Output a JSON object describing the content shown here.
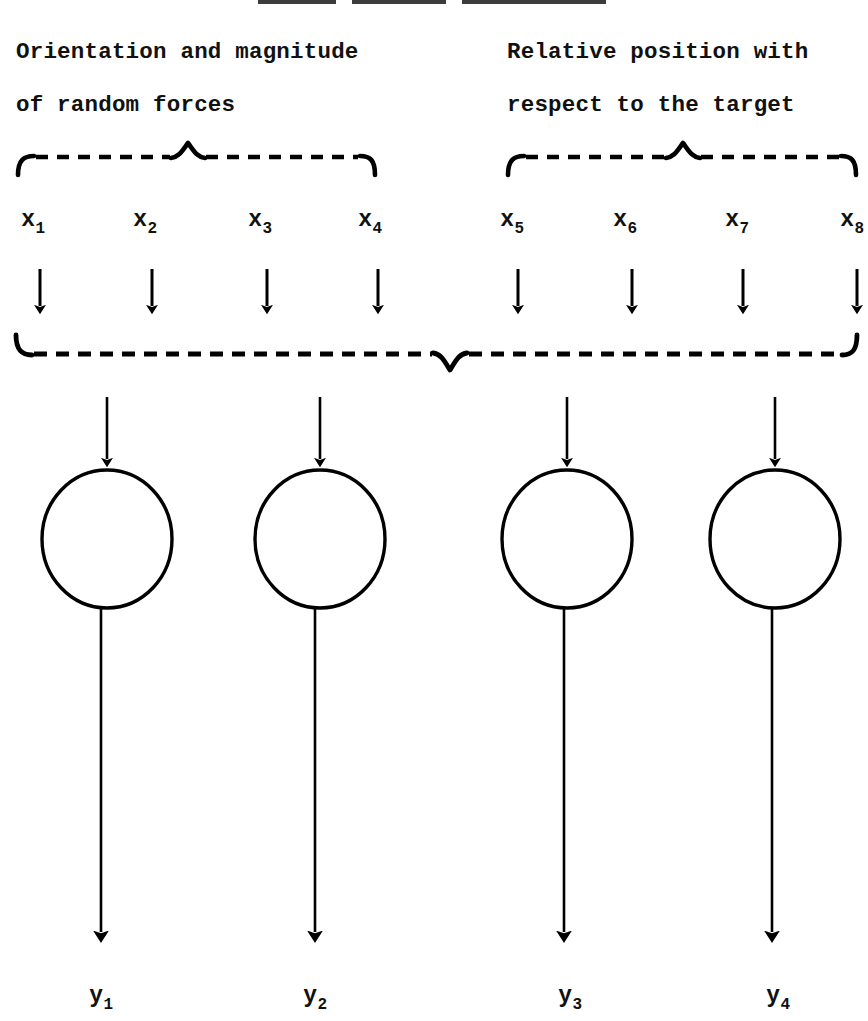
{
  "figure": {
    "title_fragment_visible": "",
    "background_color": "#ffffff",
    "ink_color": "#000000"
  },
  "groups": [
    {
      "id": "random-forces",
      "label_line1": "Orientation and magnitude",
      "label_line2": "of random forces",
      "brace_span_px": [
        18,
        375
      ],
      "brace_peak_px": 188,
      "covers_inputs": [
        "x1",
        "x2",
        "x3",
        "x4"
      ]
    },
    {
      "id": "relative-position",
      "label_line1": "Relative position with",
      "label_line2": "respect to the target",
      "brace_span_px": [
        508,
        856
      ],
      "brace_peak_px": 683,
      "covers_inputs": [
        "x5",
        "x6",
        "x7",
        "x8"
      ]
    }
  ],
  "combined_brace": {
    "id": "all-inputs-brace",
    "span_px": [
      16,
      856
    ],
    "peak_px": 450,
    "direction": "down"
  },
  "inputs": [
    {
      "name": "x",
      "sub": "1",
      "x_px": 33,
      "arrow_x_px": 40
    },
    {
      "name": "x",
      "sub": "2",
      "x_px": 145,
      "arrow_x_px": 152
    },
    {
      "name": "x",
      "sub": "3",
      "x_px": 260,
      "arrow_x_px": 267
    },
    {
      "name": "x",
      "sub": "4",
      "x_px": 370,
      "arrow_x_px": 378
    },
    {
      "name": "x",
      "sub": "5",
      "x_px": 512,
      "arrow_x_px": 518
    },
    {
      "name": "x",
      "sub": "6",
      "x_px": 625,
      "arrow_x_px": 632
    },
    {
      "name": "x",
      "sub": "7",
      "x_px": 737,
      "arrow_x_px": 743
    },
    {
      "name": "x",
      "sub": "8",
      "x_px": 852,
      "arrow_x_px": 857
    }
  ],
  "nodes": [
    {
      "id": "node-1",
      "cx_px": 107,
      "cy_px": 539,
      "rx_px": 65,
      "ry_px": 69
    },
    {
      "id": "node-2",
      "cx_px": 320,
      "cy_px": 539,
      "rx_px": 65,
      "ry_px": 69
    },
    {
      "id": "node-3",
      "cx_px": 567,
      "cy_px": 539,
      "rx_px": 65,
      "ry_px": 69
    },
    {
      "id": "node-4",
      "cx_px": 775,
      "cy_px": 539,
      "rx_px": 65,
      "ry_px": 69
    }
  ],
  "outputs": [
    {
      "name": "y",
      "sub": "1",
      "x_px": 101
    },
    {
      "name": "y",
      "sub": "2",
      "x_px": 315
    },
    {
      "name": "y",
      "sub": "3",
      "x_px": 564,
      "x_label_px": 570
    },
    {
      "name": "y",
      "sub": "4",
      "x_px": 772,
      "x_label_px": 778
    }
  ],
  "top_cropped_rules": [
    {
      "left_px": 258,
      "width_px": 78
    },
    {
      "left_px": 352,
      "width_px": 94
    },
    {
      "left_px": 462,
      "width_px": 144
    }
  ]
}
